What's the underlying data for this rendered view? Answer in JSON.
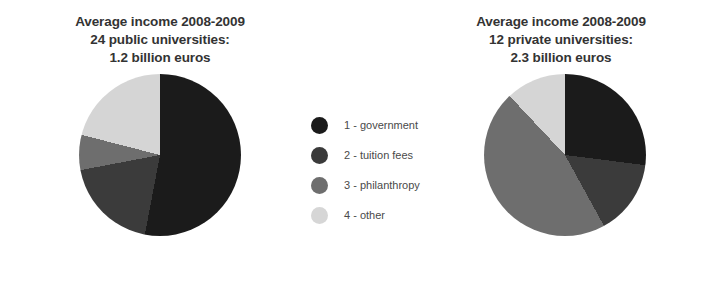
{
  "colors": {
    "government": "#1a1a1a",
    "tuition_fees": "#3a3a3a",
    "philanthropy": "#6e6e6e",
    "other": "#d6d6d6",
    "background": "#ffffff",
    "text": "#333333",
    "legend_text": "#4a4a4a"
  },
  "legend": {
    "position": "center",
    "items": [
      {
        "label": "1 - government",
        "color_key": "government"
      },
      {
        "label": "2 - tuition fees",
        "color_key": "tuition_fees"
      },
      {
        "label": "3 - philanthropy",
        "color_key": "philanthropy"
      },
      {
        "label": "4 - other",
        "color_key": "other"
      }
    ]
  },
  "panels": [
    {
      "id": "public",
      "title_lines": [
        "Average income 2008-2009",
        "24 public universities:",
        "1.2 billion euros"
      ]
    },
    {
      "id": "private",
      "title_lines": [
        "Average income 2008-2009",
        "12 private universities:",
        "2.3 billion euros"
      ]
    }
  ],
  "chart_data": [
    {
      "type": "pie",
      "id": "public-universities-income",
      "title": "Average income 2008-2009 24 public universities: 1.2 billion euros",
      "subtitle": "24 public universities: 1.2 billion euros",
      "total_label": "1.2 billion euros",
      "institution_count": 24,
      "institution_type": "public",
      "period": "2008-2009",
      "categories": [
        "1 - government",
        "2 - tuition fees",
        "3 - philanthropy",
        "4 - other"
      ],
      "values": [
        53,
        19,
        7,
        21
      ],
      "units": "percent",
      "start_angle": 0,
      "direction": "clockwise",
      "slice_colors": [
        "#1a1a1a",
        "#3a3a3a",
        "#6e6e6e",
        "#d6d6d6"
      ],
      "legend_position": "center",
      "grid": false,
      "labels_on_slices": false
    },
    {
      "type": "pie",
      "id": "private-universities-income",
      "title": "Average income 2008-2009 12 private universities: 2.3 billion euros",
      "subtitle": "12 private universities: 2.3 billion euros",
      "total_label": "2.3 billion euros",
      "institution_count": 12,
      "institution_type": "private",
      "period": "2008-2009",
      "categories": [
        "1 - government",
        "2 - tuition fees",
        "3 - philanthropy",
        "4 - other"
      ],
      "values": [
        27,
        15,
        46,
        12
      ],
      "units": "percent",
      "start_angle": 0,
      "direction": "clockwise",
      "slice_colors": [
        "#1a1a1a",
        "#3a3a3a",
        "#6e6e6e",
        "#d6d6d6"
      ],
      "legend_position": "center",
      "grid": false,
      "labels_on_slices": false
    }
  ]
}
